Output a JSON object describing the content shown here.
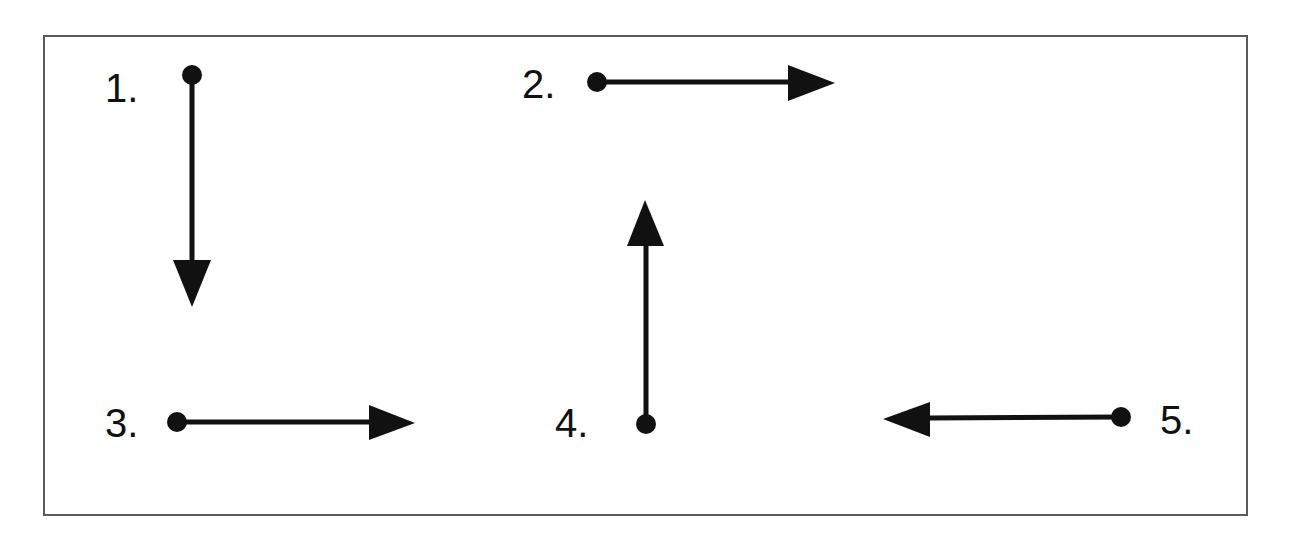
{
  "diagram": {
    "type": "directional-arrows",
    "frame": {
      "x": 43,
      "y": 35,
      "width": 1205,
      "height": 481,
      "border_color": "#5a5a5a"
    },
    "ink_color": "#111111",
    "items": [
      {
        "label": "1.",
        "direction": "down",
        "label_pos": {
          "x": 105,
          "y": 102
        },
        "start": {
          "x": 192,
          "y": 75
        },
        "shaft_end": {
          "x": 192,
          "y": 262
        },
        "head": [
          [
            173,
            260
          ],
          [
            211,
            260
          ],
          [
            192,
            307
          ]
        ]
      },
      {
        "label": "2.",
        "direction": "right",
        "label_pos": {
          "x": 522,
          "y": 98
        },
        "start": {
          "x": 597,
          "y": 82
        },
        "shaft_end": {
          "x": 790,
          "y": 82
        },
        "head": [
          [
            788,
            65
          ],
          [
            788,
            101
          ],
          [
            835,
            83
          ]
        ]
      },
      {
        "label": "3.",
        "direction": "right",
        "label_pos": {
          "x": 105,
          "y": 437
        },
        "start": {
          "x": 177,
          "y": 422
        },
        "shaft_end": {
          "x": 371,
          "y": 422
        },
        "head": [
          [
            369,
            405
          ],
          [
            369,
            440
          ],
          [
            415,
            423
          ]
        ]
      },
      {
        "label": "4.",
        "direction": "up",
        "label_pos": {
          "x": 555,
          "y": 437
        },
        "start": {
          "x": 646,
          "y": 424
        },
        "shaft_end": {
          "x": 646,
          "y": 244
        },
        "head": [
          [
            627,
            246
          ],
          [
            664,
            246
          ],
          [
            645,
            200
          ]
        ]
      },
      {
        "label": "5.",
        "direction": "left",
        "label_pos": {
          "x": 1160,
          "y": 434
        },
        "start": {
          "x": 1121,
          "y": 417
        },
        "shaft_end": {
          "x": 928,
          "y": 418
        },
        "head": [
          [
            930,
            402
          ],
          [
            930,
            437
          ],
          [
            883,
            419
          ]
        ]
      }
    ]
  }
}
